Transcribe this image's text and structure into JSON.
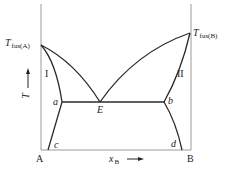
{
  "diagram": {
    "type": "eutectic phase diagram with partial solid solubility",
    "colors": {
      "axis": "#9a9a9a",
      "curve": "#2a2a2a",
      "text": "#222222",
      "background": "#ffffff"
    },
    "labels": {
      "t_fus_a": {
        "main": "T",
        "sub": "fus(A)"
      },
      "t_fus_b": {
        "main": "T",
        "sub": "fus(B)"
      },
      "region_1": "I",
      "region_2": "II",
      "point_a": "a",
      "point_b": "b",
      "point_c": "c",
      "point_d": "d",
      "point_e": "E",
      "component_a": "A",
      "component_b": "B",
      "y_axis": "T",
      "x_axis": {
        "main": "x",
        "sub": "B"
      }
    }
  }
}
